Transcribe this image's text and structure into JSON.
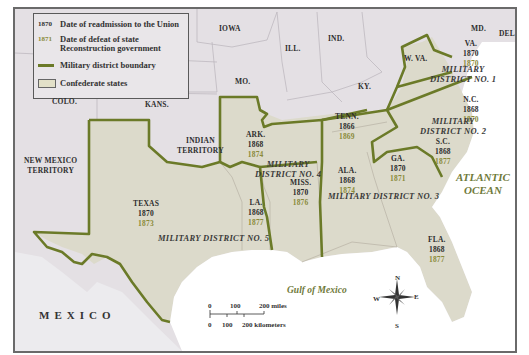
{
  "legend": {
    "items": [
      {
        "key": "1870",
        "label": "Date of readmission to the Union",
        "color": "#2a2a2a"
      },
      {
        "key": "1871",
        "label": "Date of defeat of state",
        "label2": "Reconstruction government",
        "color": "#8a8a3a"
      },
      {
        "key": "line",
        "label": "Military district boundary",
        "color": "#6a7a2a"
      },
      {
        "key": "box",
        "label": "Confederate states",
        "color": "#e0dfc8"
      }
    ]
  },
  "colors": {
    "confederate_fill": "#dcdacb",
    "union_fill": "#e4e0e4",
    "district_line": "#6b7a28",
    "water": "#ffffff",
    "ocean_text": "#6f7a3a",
    "defeat_year": "#8a8a3a"
  },
  "non_confederate_labels": [
    "IOWA",
    "ILL.",
    "IND.",
    "MO.",
    "KY.",
    "W. VA.",
    "MD.",
    "DEL.",
    "COLO.",
    "KANS.",
    "INDIAN",
    "TERRITORY",
    "NEW MEXICO",
    "TERRITORY",
    "MEXICO"
  ],
  "states": {
    "va": {
      "name": "VA.",
      "readmit": "1870",
      "defeat": "1870"
    },
    "nc": {
      "name": "N.C.",
      "readmit": "1868",
      "defeat": "1870"
    },
    "sc": {
      "name": "S.C.",
      "readmit": "1868",
      "defeat": "1877"
    },
    "ga": {
      "name": "GA.",
      "readmit": "1870",
      "defeat": "1871"
    },
    "fla": {
      "name": "FLA.",
      "readmit": "1868",
      "defeat": "1877"
    },
    "ala": {
      "name": "ALA.",
      "readmit": "1868",
      "defeat": "1874"
    },
    "tenn": {
      "name": "TENN.",
      "readmit": "1866",
      "defeat": "1869"
    },
    "miss": {
      "name": "MISS.",
      "readmit": "1870",
      "defeat": "1876"
    },
    "ark": {
      "name": "ARK.",
      "readmit": "1868",
      "defeat": "1874"
    },
    "la": {
      "name": "LA.",
      "readmit": "1868",
      "defeat": "1877"
    },
    "texas": {
      "name": "TEXAS",
      "readmit": "1870",
      "defeat": "1873"
    }
  },
  "districts": {
    "d1": {
      "line1": "MILITARY",
      "line2": "DISTRICT NO. 1"
    },
    "d2": {
      "line1": "MILITARY",
      "line2": "DISTRICT NO. 2"
    },
    "d3": {
      "line1": "MILITARY DISTRICT NO. 3"
    },
    "d4": {
      "line1": "MILITARY",
      "line2": "DISTRICT NO. 4"
    },
    "d5": {
      "line1": "MILITARY DISTRICT NO. 5"
    }
  },
  "other_labels": {
    "iowa": "IOWA",
    "ill": "ILL.",
    "ind": "IND.",
    "mo": "MO.",
    "ky": "KY.",
    "wva": "W. VA.",
    "md": "MD.",
    "del": "DEL.",
    "colo": "COLO.",
    "kans": "KANS.",
    "indian1": "INDIAN",
    "indian2": "TERRITORY",
    "nm1": "NEW MEXICO",
    "nm2": "TERRITORY",
    "mexico": "MEXICO"
  },
  "water_labels": {
    "atlantic1": "ATLANTIC",
    "atlantic2": "OCEAN",
    "gulf": "Gulf of Mexico"
  },
  "scale_bar": {
    "miles": [
      "0",
      "100",
      "200 miles"
    ],
    "km": [
      "0",
      "100",
      "200 kilometers"
    ]
  },
  "compass": {
    "n": "N",
    "s": "S",
    "e": "E",
    "w": "W"
  }
}
